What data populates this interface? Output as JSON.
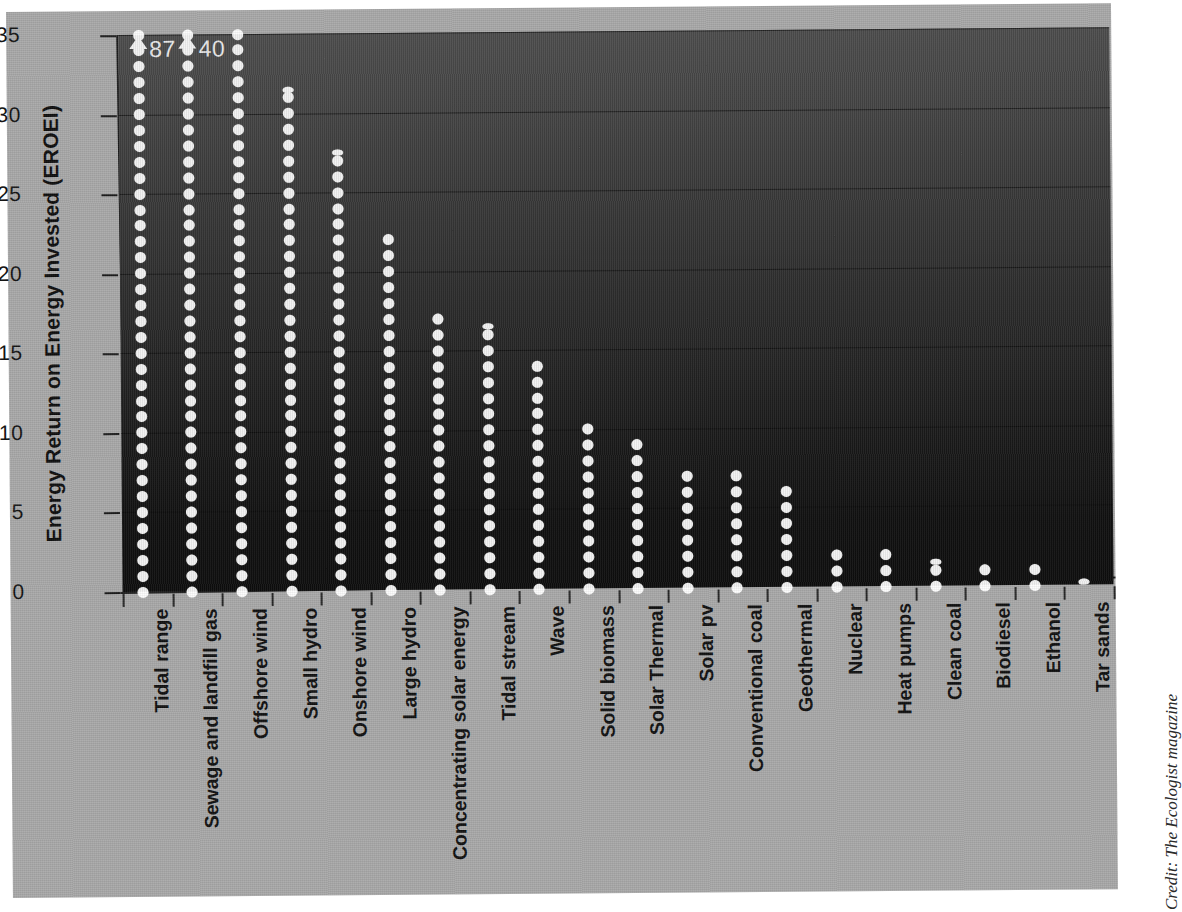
{
  "chart_data": {
    "type": "bar",
    "title": "",
    "xlabel": "",
    "ylabel": "Energy Return on Energy Invested (EROEI)",
    "ylim": [
      0,
      35
    ],
    "yticks": [
      0,
      5,
      10,
      15,
      20,
      25,
      30,
      35
    ],
    "ytick_labels": [
      "0",
      "5",
      "10",
      "15",
      "20",
      "25",
      "30",
      "35"
    ],
    "grid": true,
    "legend": "none",
    "note": "Each white dot represents one unit of EROEI; columns exceeding the axis are capped with an up-arrow and annotated with their true value.",
    "categories": [
      "Tidal range",
      "Sewage and landfill gas",
      "Offshore wind",
      "Small hydro",
      "Onshore wind",
      "Large hydro",
      "Concentrating solar energy",
      "Tidal stream",
      "Wave",
      "Solid biomass",
      "Solar Thermal",
      "Solar pv",
      "Conventional coal",
      "Geothermal",
      "Nuclear",
      "Heat pumps",
      "Clean coal",
      "Biodiesel",
      "Ethanol",
      "Tar sands"
    ],
    "values": [
      87,
      40,
      35,
      31.5,
      27.5,
      22,
      17,
      16.5,
      14,
      10,
      9,
      7,
      7,
      6,
      2,
      2,
      1.5,
      1,
      1,
      0.2
    ],
    "overflow": [
      {
        "category": "Tidal range",
        "label": "87"
      },
      {
        "category": "Sewage and landfill gas",
        "label": "40"
      }
    ]
  },
  "credit": {
    "text": "Credit: The Ecologist magazine"
  }
}
